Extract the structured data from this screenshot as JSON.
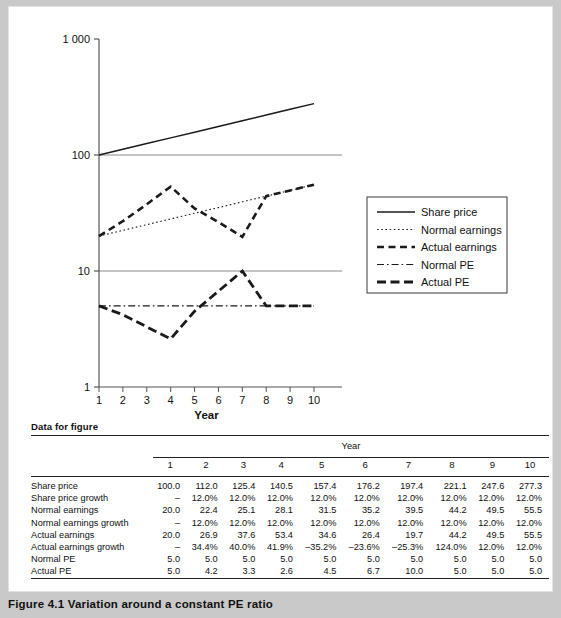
{
  "caption": "Figure 4.1  Variation around a constant PE ratio",
  "data_section_heading": "Data for figure",
  "chart_data": {
    "type": "line",
    "title": "",
    "xlabel": "Year",
    "ylabel": "",
    "yscale": "log",
    "ylim": [
      1,
      1000
    ],
    "ytick_labels": [
      "1",
      "10",
      "100",
      "1 000"
    ],
    "ytick_values": [
      1,
      10,
      100,
      1000
    ],
    "x": [
      1,
      2,
      3,
      4,
      5,
      6,
      7,
      8,
      9,
      10
    ],
    "xtick_labels": [
      "1",
      "2",
      "3",
      "4",
      "5",
      "6",
      "7",
      "8",
      "9",
      "10"
    ],
    "grid": false,
    "legend_position": "right",
    "series": [
      {
        "name": "Share price",
        "style": "solid",
        "values": [
          100.0,
          112.0,
          125.4,
          140.5,
          157.4,
          176.2,
          197.4,
          221.1,
          247.6,
          277.3
        ]
      },
      {
        "name": "Normal earnings",
        "style": "dotted",
        "values": [
          20.0,
          22.4,
          25.1,
          28.1,
          31.5,
          35.2,
          39.5,
          44.2,
          49.5,
          55.5
        ]
      },
      {
        "name": "Actual earnings",
        "style": "dashed",
        "values": [
          20.0,
          26.9,
          37.6,
          53.4,
          34.6,
          26.4,
          19.7,
          44.2,
          49.5,
          55.5
        ]
      },
      {
        "name": "Normal PE",
        "style": "dash-dot",
        "values": [
          5.0,
          5.0,
          5.0,
          5.0,
          5.0,
          5.0,
          5.0,
          5.0,
          5.0,
          5.0
        ]
      },
      {
        "name": "Actual PE",
        "style": "long-dash",
        "values": [
          5.0,
          4.2,
          3.3,
          2.6,
          4.5,
          6.7,
          10.0,
          5.0,
          5.0,
          5.0
        ]
      }
    ]
  },
  "table": {
    "group_header": "Year",
    "columns": [
      "1",
      "2",
      "3",
      "4",
      "5",
      "6",
      "7",
      "8",
      "9",
      "10"
    ],
    "rows": [
      {
        "label": "Share price",
        "values": [
          "100.0",
          "112.0",
          "125.4",
          "140.5",
          "157.4",
          "176.2",
          "197.4",
          "221.1",
          "247.6",
          "277.3"
        ]
      },
      {
        "label": "Share price growth",
        "values": [
          "–",
          "12.0%",
          "12.0%",
          "12.0%",
          "12.0%",
          "12.0%",
          "12.0%",
          "12.0%",
          "12.0%",
          "12.0%"
        ]
      },
      {
        "label": "Normal earnings",
        "values": [
          "20.0",
          "22.4",
          "25.1",
          "28.1",
          "31.5",
          "35.2",
          "39.5",
          "44.2",
          "49.5",
          "55.5"
        ]
      },
      {
        "label": "Normal earnings growth",
        "values": [
          "–",
          "12.0%",
          "12.0%",
          "12.0%",
          "12.0%",
          "12.0%",
          "12.0%",
          "12.0%",
          "12.0%",
          "12.0%"
        ]
      },
      {
        "label": "Actual earnings",
        "values": [
          "20.0",
          "26.9",
          "37.6",
          "53.4",
          "34.6",
          "26.4",
          "19.7",
          "44.2",
          "49.5",
          "55.5"
        ]
      },
      {
        "label": "Actual earnings growth",
        "values": [
          "–",
          "34.4%",
          "40.0%",
          "41.9%",
          "–35.2%",
          "–23.6%",
          "–25.3%",
          "124.0%",
          "12.0%",
          "12.0%"
        ]
      },
      {
        "label": "Normal PE",
        "values": [
          "5.0",
          "5.0",
          "5.0",
          "5.0",
          "5.0",
          "5.0",
          "5.0",
          "5.0",
          "5.0",
          "5.0"
        ]
      },
      {
        "label": "Actual PE",
        "values": [
          "5.0",
          "4.2",
          "3.3",
          "2.6",
          "4.5",
          "6.7",
          "10.0",
          "5.0",
          "5.0",
          "5.0"
        ]
      }
    ]
  },
  "colors": {
    "line": "#1a1a1a",
    "axis": "#555555",
    "gridline": "#888888",
    "page_bg": "#c9c9c9",
    "card_bg": "#ffffff"
  }
}
